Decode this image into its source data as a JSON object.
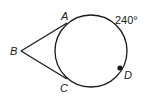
{
  "diagram": {
    "type": "geometry",
    "points": {
      "A": {
        "label": "A"
      },
      "B": {
        "label": "B"
      },
      "C": {
        "label": "C"
      },
      "D": {
        "label": "D"
      }
    },
    "arc_label": "240°",
    "colors": {
      "stroke": "#1a1a1a",
      "background": "#ffffff"
    }
  }
}
